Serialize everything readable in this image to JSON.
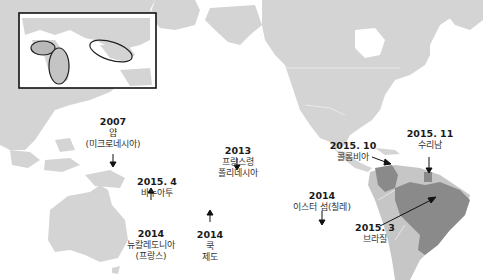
{
  "map": {
    "title": "",
    "land_color": "#d4d4d4",
    "highlight_color": "#8a8a8a",
    "inset": {
      "regions": [
        "west-africa",
        "central-africa",
        "southeast-asia"
      ]
    },
    "events": [
      {
        "id": "yap",
        "year": "2007",
        "place": "얍",
        "place2": "(미크로네시아)",
        "arrow": "down"
      },
      {
        "id": "vanuatu",
        "year": "2015. 4",
        "place": "바누아투",
        "arrow": "none"
      },
      {
        "id": "new-caledonia",
        "year": "2014",
        "place": "뉴칼레도니아",
        "place2": "(프랑스)",
        "arrow": "up"
      },
      {
        "id": "french-polynesia",
        "year": "2013",
        "place": "프랑스령",
        "place2": "폴리네시아",
        "arrow": "down"
      },
      {
        "id": "cook-islands",
        "year": "2014",
        "place": "쿡",
        "place2": "제도",
        "arrow": "up"
      },
      {
        "id": "easter-island",
        "year": "2014",
        "place": "이스터 섬(칠레)",
        "arrow": "down"
      },
      {
        "id": "colombia",
        "year": "2015. 10",
        "place": "콜롬비아",
        "arrow": "right-down"
      },
      {
        "id": "suriname",
        "year": "2015. 11",
        "place": "수리남",
        "arrow": "down"
      },
      {
        "id": "brazil",
        "year": "2015. 3",
        "place": "브라질",
        "arrow": "up-right"
      }
    ]
  }
}
